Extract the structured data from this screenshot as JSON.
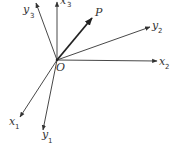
{
  "diagram": {
    "title": "",
    "origin": {
      "label": "O",
      "x": 57,
      "y": 60
    },
    "axes": [
      {
        "id": "x3",
        "label": "x",
        "subscript": "3",
        "tip": [
          57,
          2
        ]
      },
      {
        "id": "y3",
        "label": "y",
        "subscript": "3",
        "tip": [
          36,
          3
        ]
      },
      {
        "id": "y2",
        "label": "y",
        "subscript": "2",
        "tip": [
          150,
          27
        ]
      },
      {
        "id": "x2",
        "label": "x",
        "subscript": "2",
        "tip": [
          158,
          61
        ]
      },
      {
        "id": "x1",
        "label": "x",
        "subscript": "1",
        "tip": [
          20,
          117
        ]
      },
      {
        "id": "y1",
        "label": "y",
        "subscript": "1",
        "tip": [
          43,
          130
        ]
      }
    ],
    "vector": {
      "id": "OP",
      "label": "P",
      "tip": [
        93,
        17
      ]
    },
    "colors": {
      "ink": "#333333",
      "background": "#ffffff"
    }
  }
}
